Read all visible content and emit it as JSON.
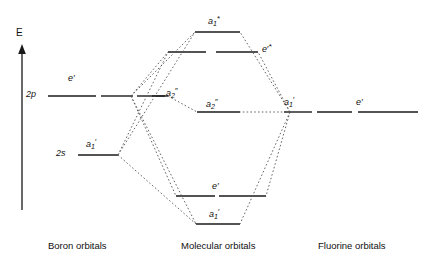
{
  "figure": {
    "type": "molecular-orbital-diagram",
    "axis": {
      "label": "E",
      "meaning": "energy-increasing-upward"
    },
    "columns": [
      {
        "id": "boron",
        "footer": "Boron orbitals"
      },
      {
        "id": "molecular",
        "footer": "Molecular orbitals"
      },
      {
        "id": "fluorine",
        "footer": "Fluorine orbitals"
      }
    ],
    "levels": {
      "boron": [
        {
          "id": "b-2p",
          "axis_label": "2p",
          "symmetry_label": "e",
          "prime": "′"
        },
        {
          "id": "b-2s",
          "axis_label": "2s",
          "symmetry_label": "a",
          "sub": "1",
          "prime": "′"
        }
      ],
      "boron_extra": [
        {
          "id": "b-a2pp",
          "symmetry_label": "a",
          "sub": "2",
          "prime": "″"
        }
      ],
      "molecular": [
        {
          "id": "mo-a1-star",
          "symmetry_label": "a",
          "sub": "1",
          "prime": "",
          "star": "*"
        },
        {
          "id": "mo-e-star",
          "symmetry_label": "e",
          "prime": "′",
          "star": "*"
        },
        {
          "id": "mo-a2pp",
          "symmetry_label": "a",
          "sub": "2",
          "prime": "″"
        },
        {
          "id": "mo-e",
          "symmetry_label": "e",
          "prime": "′"
        },
        {
          "id": "mo-a1",
          "symmetry_label": "a",
          "sub": "1",
          "prime": "′"
        }
      ],
      "fluorine": [
        {
          "id": "f-a1",
          "symmetry_label": "a",
          "sub": "1",
          "prime": "′"
        },
        {
          "id": "f-e",
          "symmetry_label": "e",
          "prime": "′"
        }
      ]
    },
    "label_text": {
      "axis_E": "E",
      "boron_2p": "2p",
      "boron_2s": "2s",
      "boron_e_prime": "e′",
      "boron_a1_prime": "a",
      "boron_a1_sub": "1",
      "boron_a1_prime_mark": "′",
      "boron_a2_pp": "a",
      "boron_a2_sub": "2",
      "boron_a2_pp_mark": "″",
      "mo_a1_star": "a",
      "mo_a1_star_sub": "1",
      "mo_a1_star_mark": "*",
      "mo_e_star": "e",
      "mo_e_star_prime": "′",
      "mo_e_star_mark": "*",
      "mo_a2_pp": "a",
      "mo_a2_pp_sub": "2",
      "mo_a2_pp_mark": "″",
      "mo_e_prime": "e′",
      "mo_a1_prime": "a",
      "mo_a1_prime_sub": "1",
      "mo_a1_prime_mark": "′",
      "f_a1_prime": "a",
      "f_a1_prime_sub": "1",
      "f_a1_prime_mark": "′",
      "f_e_prime": "e′",
      "footer_boron": "Boron orbitals",
      "footer_molecular": "Molecular orbitals",
      "footer_fluorine": "Fluorine orbitals"
    },
    "colors": {
      "level_stroke": "#1a1a1a",
      "correlation_stroke": "#555555",
      "text": "#111111",
      "background": "#ffffff"
    }
  }
}
